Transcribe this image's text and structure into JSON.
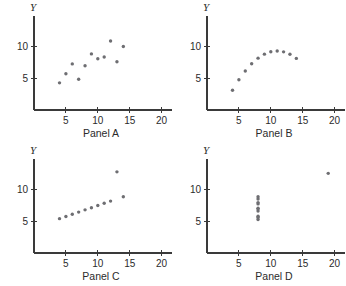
{
  "figure": {
    "layout": "2x2 grid of scatter panels",
    "background_color": "#ffffff",
    "point_color": "#6e6e72",
    "axis_color": "#3a3a3a"
  },
  "chart_data": [
    {
      "type": "scatter",
      "title": "Panel A",
      "xlabel": "Panel A",
      "ylabel": "Y",
      "xlim": [
        0,
        21
      ],
      "ylim": [
        0,
        13.5
      ],
      "xticks": [
        5,
        10,
        15,
        20
      ],
      "yticks": [
        5,
        10
      ],
      "grid": false,
      "legend": "none",
      "x": [
        10,
        8,
        13,
        9,
        11,
        14,
        6,
        4,
        12,
        7,
        5
      ],
      "y": [
        8.04,
        6.95,
        7.58,
        8.81,
        8.33,
        9.96,
        7.24,
        4.26,
        10.84,
        4.82,
        5.68
      ]
    },
    {
      "type": "scatter",
      "title": "Panel B",
      "xlabel": "Panel B",
      "ylabel": "Y",
      "xlim": [
        0,
        21
      ],
      "ylim": [
        0,
        13.5
      ],
      "xticks": [
        5,
        10,
        15,
        20
      ],
      "yticks": [
        5,
        10
      ],
      "grid": false,
      "legend": "none",
      "x": [
        10,
        8,
        13,
        9,
        11,
        14,
        6,
        4,
        12,
        7,
        5
      ],
      "y": [
        9.14,
        8.14,
        8.74,
        8.77,
        9.26,
        8.1,
        6.13,
        3.1,
        9.13,
        7.26,
        4.74
      ]
    },
    {
      "type": "scatter",
      "title": "Panel C",
      "xlabel": "Panel C",
      "ylabel": "Y",
      "xlim": [
        0,
        21
      ],
      "ylim": [
        0,
        13.5
      ],
      "xticks": [
        5,
        10,
        15,
        20
      ],
      "yticks": [
        5,
        10
      ],
      "grid": false,
      "legend": "none",
      "x": [
        10,
        8,
        13,
        9,
        11,
        14,
        6,
        4,
        12,
        7,
        5
      ],
      "y": [
        7.46,
        6.77,
        12.74,
        7.11,
        7.81,
        8.84,
        6.08,
        5.39,
        8.15,
        6.42,
        5.73
      ]
    },
    {
      "type": "scatter",
      "title": "Panel D",
      "xlabel": "Panel D",
      "ylabel": "Y",
      "xlim": [
        0,
        21
      ],
      "ylim": [
        0,
        13.5
      ],
      "xticks": [
        5,
        10,
        15,
        20
      ],
      "yticks": [
        5,
        10
      ],
      "grid": false,
      "legend": "none",
      "x": [
        8,
        8,
        8,
        8,
        8,
        8,
        8,
        19,
        8,
        8,
        8
      ],
      "y": [
        6.58,
        5.76,
        7.71,
        8.84,
        8.47,
        7.04,
        5.25,
        12.5,
        5.56,
        7.91,
        6.89
      ]
    }
  ]
}
